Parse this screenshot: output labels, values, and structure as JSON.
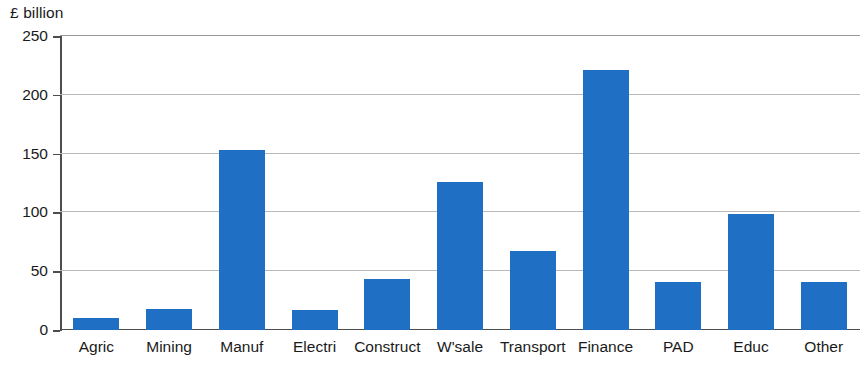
{
  "chart_data": {
    "type": "bar",
    "title": "",
    "subtitle": "",
    "xlabel": "",
    "ylabel": "£ billion",
    "ylim": [
      0,
      250
    ],
    "yticks": [
      0,
      50,
      100,
      150,
      200,
      250
    ],
    "ytick_labels": [
      "0",
      "50",
      "100",
      "150",
      "200",
      "250"
    ],
    "grid": "horizontal",
    "legend": "none",
    "bar_color": "#1f6fc4",
    "categories": [
      "Agric",
      "Mining",
      "Manuf",
      "Electri",
      "Construct",
      "W'sale",
      "Transport",
      "Finance",
      "PAD",
      "Educ",
      "Other"
    ],
    "values": [
      10,
      18,
      153,
      17,
      43,
      126,
      67,
      221,
      41,
      99,
      41
    ]
  },
  "colors": {
    "bar": "#1f6fc4",
    "gridline": "#b9b9b9",
    "axis": "#4d4d4d",
    "text": "#1a1a1a",
    "background": "#ffffff"
  }
}
